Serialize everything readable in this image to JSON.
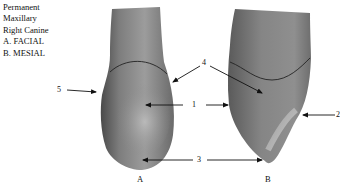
{
  "caption": {
    "lines": [
      "Permanent",
      "Maxillary",
      "Right Canine",
      "A. FACIAL",
      "B. MESIAL"
    ]
  },
  "labels": {
    "l1": "1",
    "l2": "2",
    "l3": "3",
    "l4": "4",
    "l5": "5"
  },
  "views": {
    "a": "A",
    "b": "B"
  },
  "colors": {
    "tooth_fill": "#8a8a8a",
    "tooth_dark": "#555555",
    "tooth_light": "#b5b5b5",
    "line": "#111111"
  }
}
